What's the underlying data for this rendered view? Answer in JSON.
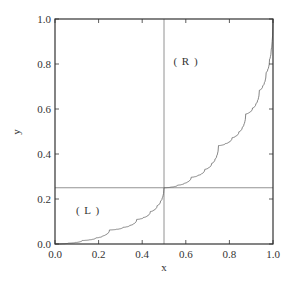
{
  "chart_data": {
    "type": "line",
    "title": "",
    "xlabel": "x",
    "ylabel": "y",
    "xlim": [
      0.0,
      1.0
    ],
    "ylim": [
      0.0,
      1.0
    ],
    "grid": false,
    "legend": null,
    "xticks": [
      "0.0",
      "0.2",
      "0.4",
      "0.6",
      "0.8",
      "1.0"
    ],
    "yticks": [
      "0.0",
      "0.2",
      "0.4",
      "0.6",
      "0.8",
      "1.0"
    ],
    "series": [
      {
        "name": "singular function",
        "description": "Self-similar increasing curve: f(x/2)=f(x)/4, f((1+x)/2)=1/4+3f(x)/4",
        "x": [
          0.0,
          0.0625,
          0.125,
          0.1875,
          0.25,
          0.3125,
          0.375,
          0.4375,
          0.5,
          0.5625,
          0.625,
          0.6875,
          0.75,
          0.8125,
          0.875,
          0.9375,
          1.0
        ],
        "y": [
          0.0,
          0.0039,
          0.0156,
          0.0273,
          0.0625,
          0.0742,
          0.1094,
          0.168,
          0.25,
          0.2617,
          0.2969,
          0.3555,
          0.4375,
          0.4727,
          0.5781,
          0.7539,
          1.0
        ],
        "color": "#666666"
      }
    ],
    "reference_lines": [
      {
        "orientation": "vertical",
        "x": 0.5,
        "color": "#666666"
      },
      {
        "orientation": "horizontal",
        "y": 0.25,
        "color": "#666666"
      }
    ],
    "annotations": [
      {
        "text": "( L )",
        "x": 0.15,
        "y": 0.15
      },
      {
        "text": "( R )",
        "x": 0.6,
        "y": 0.81
      }
    ],
    "recursion": {
      "a": 0.25,
      "depth": 9
    }
  },
  "axes": {
    "xlabel": "x",
    "ylabel": "y",
    "xtick_labels": [
      "0.0",
      "0.2",
      "0.4",
      "0.6",
      "0.8",
      "1.0"
    ],
    "ytick_labels": [
      "0.0",
      "0.2",
      "0.4",
      "0.6",
      "0.8",
      "1.0"
    ]
  },
  "annotations": {
    "left": "( L )",
    "right": "( R )"
  },
  "colors": {
    "axis": "#333333",
    "curve": "#666666",
    "reference": "#777777"
  }
}
